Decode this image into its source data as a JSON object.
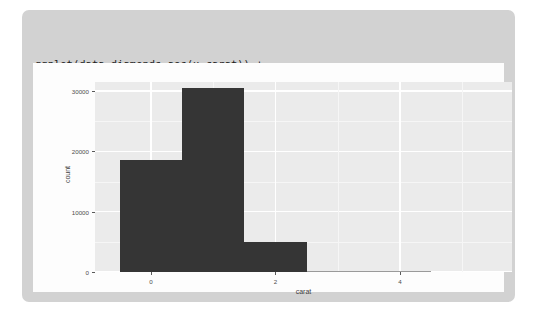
{
  "card": {
    "background_color": "#d2d2d2"
  },
  "code": {
    "language": "r",
    "lines": [
      "ggplot(data=diamonds,aes(x=carat)) +",
      "geom_histogram(binwidth = 1)"
    ]
  },
  "plot": {
    "panel_background_color": "#ebebeb",
    "gridline_color": "#ffffff",
    "bar_fill_color": "#353535",
    "axis_text_color": "#4d4d4d"
  },
  "chart_data": {
    "type": "bar",
    "title": "",
    "subtitle": "",
    "xlabel": "carat",
    "ylabel": "count",
    "xlim": [
      -0.9,
      5.8
    ],
    "ylim": [
      0,
      31500
    ],
    "grid": true,
    "legend": "none",
    "binwidth": 1,
    "x_ticks": [
      0,
      2,
      4
    ],
    "x_tick_labels": [
      "0",
      "2",
      "4"
    ],
    "y_ticks": [
      0,
      10000,
      20000,
      30000
    ],
    "y_tick_labels": [
      "0",
      "10000",
      "20000",
      "30000"
    ],
    "x_minor_ticks": [
      1,
      3,
      5
    ],
    "y_minor_ticks": [
      5000,
      15000,
      25000
    ],
    "bins": [
      {
        "left": -0.5,
        "right": 0.5,
        "center": 0,
        "count": 18500
      },
      {
        "left": 0.5,
        "right": 1.5,
        "center": 1,
        "count": 30500
      },
      {
        "left": 1.5,
        "right": 2.5,
        "center": 2,
        "count": 5000
      },
      {
        "left": 2.5,
        "right": 3.5,
        "center": 3,
        "count": 120
      },
      {
        "left": 3.5,
        "right": 4.5,
        "center": 4,
        "count": 30
      }
    ],
    "categories": [
      "0",
      "1",
      "2",
      "3",
      "4"
    ],
    "values": [
      18500,
      30500,
      5000,
      120,
      30
    ],
    "annotations": []
  }
}
